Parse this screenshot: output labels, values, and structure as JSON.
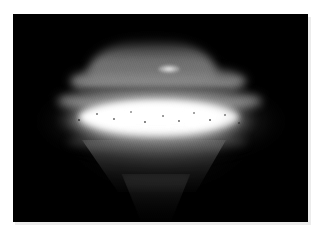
{
  "document": {
    "kind": "photograph",
    "title": "Low-light photograph of a luminous lens-shaped object",
    "orientation": "landscape"
  },
  "frame": {
    "border_color": "#ffffff",
    "shadow_color": "#ececec",
    "background_color": "#000000",
    "photo_width_px": 295,
    "photo_height_px": 208,
    "canvas_width_px": 322,
    "canvas_height_px": 239
  },
  "scene": {
    "background_label": "night sky / dark background",
    "subject_label": "luminous disc-shaped object",
    "palette": {
      "black": "#000000",
      "deep_shadow": "#0a0a0a",
      "dim_grey": "#3a3a3a",
      "mid_grey": "#6e6e6e",
      "light_grey": "#9e9e9e",
      "near_white": "#e8e8e8",
      "white_core": "#ffffff"
    },
    "regions": [
      {
        "name": "upper-dome",
        "label": "Upper dome / top deck",
        "brightness": "mid grey",
        "hex": "#8c8c8c"
      },
      {
        "name": "upper-deck-band",
        "label": "Second upper deck band",
        "brightness": "light grey",
        "hex": "#a0a0a0"
      },
      {
        "name": "deck-seam",
        "label": "Dark seam line below upper deck",
        "brightness": "near black",
        "hex": "#101010"
      },
      {
        "name": "dome-highlight",
        "label": "Small bright highlight on upper deck",
        "brightness": "white",
        "hex": "#ffffff"
      },
      {
        "name": "equatorial-core",
        "label": "Bright equatorial band (saturated core)",
        "brightness": "white, blown out",
        "hex": "#ffffff"
      },
      {
        "name": "core-speckles",
        "label": "Dark pixel speckles across bright core",
        "brightness": "black specks",
        "hex": "#000000"
      },
      {
        "name": "lower-hull",
        "label": "Tapering lower hull glow",
        "brightness": "dim grey",
        "hex": "#4a4a4a"
      },
      {
        "name": "lower-tail",
        "label": "Faint downward tail / exhaust cone",
        "brightness": "very dim grey",
        "hex": "#2a2a2a"
      },
      {
        "name": "halo",
        "label": "Ambient halo around object",
        "brightness": "dim grey",
        "hex": "#555555"
      }
    ],
    "texture": {
      "name": "dither-grain",
      "label": "Diagonal dither / scan grain",
      "angle_deg": 68,
      "opacity": 0.16
    }
  }
}
